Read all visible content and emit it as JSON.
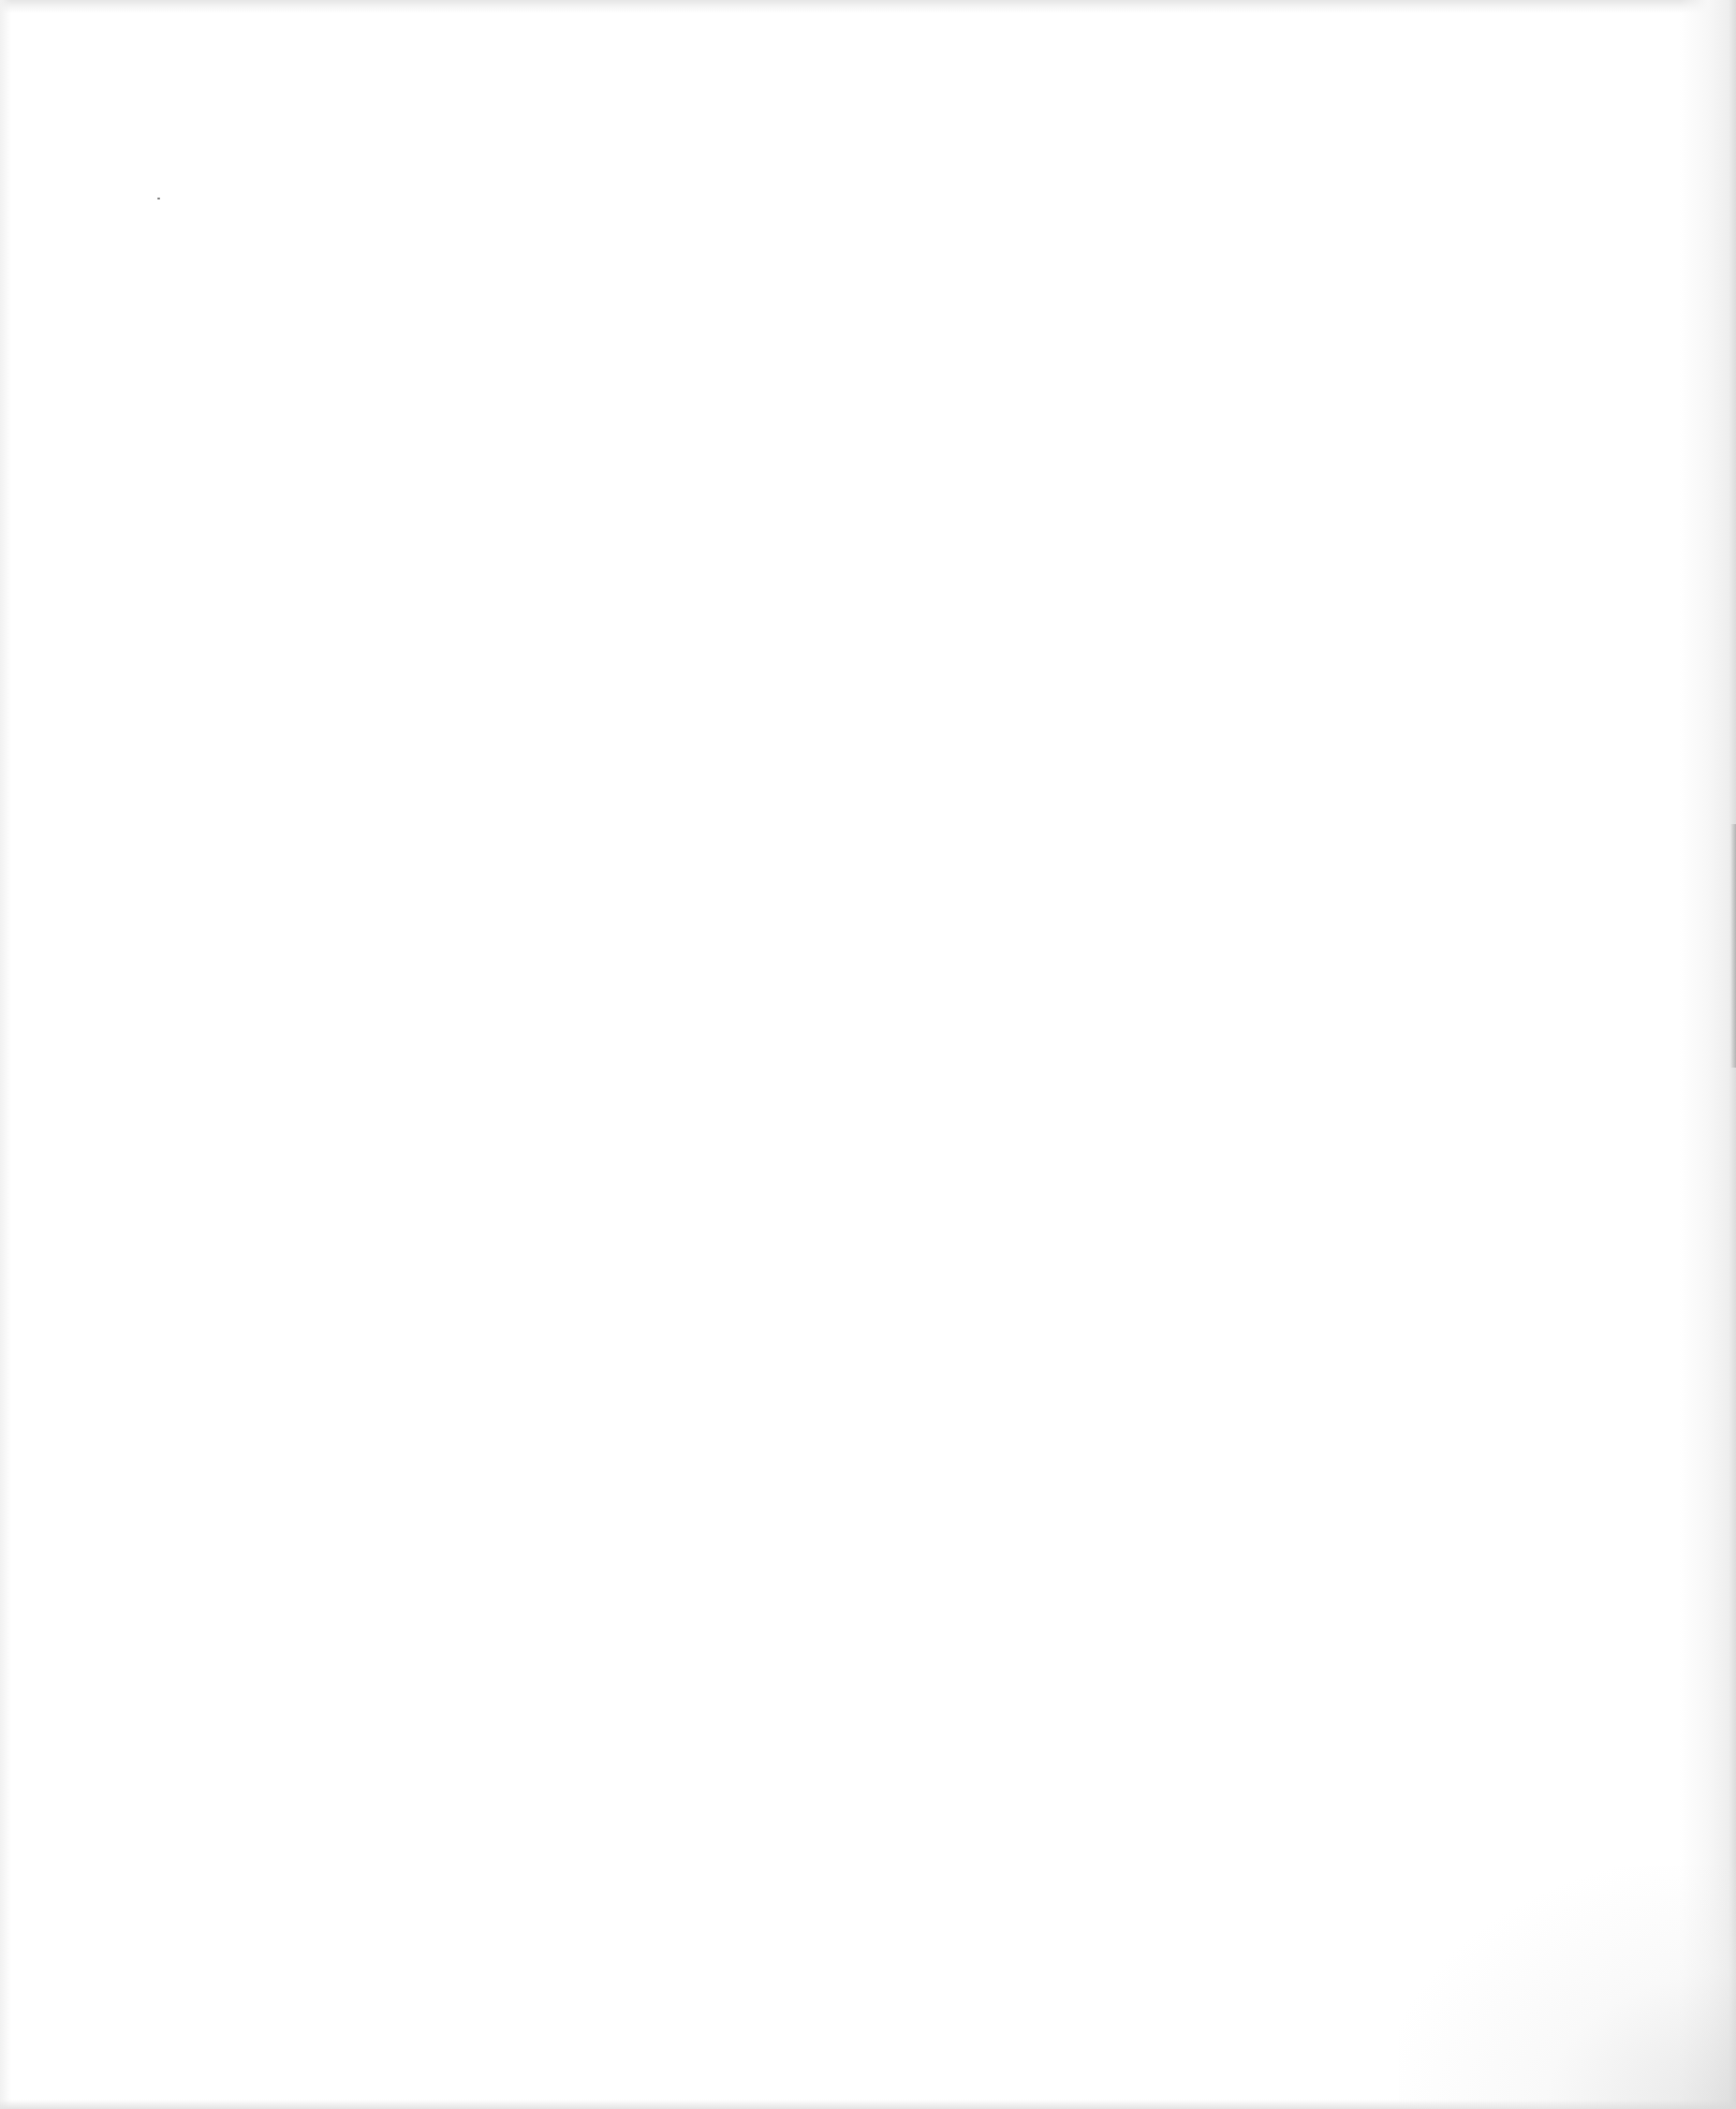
{
  "page": {
    "type": "blank-scanned-page",
    "background_color": "#ffffff",
    "edge_shade_color": "#dcdcdc",
    "text_content": []
  }
}
